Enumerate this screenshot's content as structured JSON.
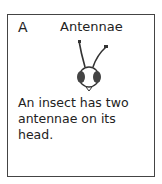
{
  "card": {
    "letter": "A",
    "word": "Antennae",
    "illustration": "insect-head-with-antennae",
    "description": "An insect has two antennae on its head."
  }
}
